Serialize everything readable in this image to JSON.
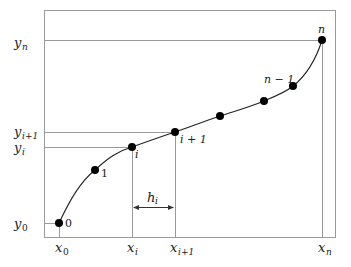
{
  "diagram": {
    "type": "piecewise-curve-interpolation",
    "frame": {
      "left": 44,
      "top": 10,
      "right": 336,
      "bottom": 238
    },
    "y_axis_labels": [
      {
        "id": "yn",
        "base": "y",
        "sub": "n",
        "y": 40
      },
      {
        "id": "yi1",
        "base": "y",
        "sub": "i+1",
        "y": 132
      },
      {
        "id": "yi",
        "base": "y",
        "sub": "i",
        "y": 147
      },
      {
        "id": "y0",
        "base": "y",
        "sub": "0",
        "y": 223
      }
    ],
    "x_axis_labels": [
      {
        "id": "x0",
        "base": "x",
        "sub": "0",
        "x": 59
      },
      {
        "id": "xi",
        "base": "x",
        "sub": "i",
        "x": 132
      },
      {
        "id": "xi1",
        "base": "x",
        "sub": "i+1",
        "x": 175
      },
      {
        "id": "xn",
        "base": "x",
        "sub": "n",
        "x": 322
      }
    ],
    "points": [
      {
        "id": "p0",
        "x": 59,
        "y": 223,
        "label": "0"
      },
      {
        "id": "p1",
        "x": 95,
        "y": 170,
        "label": "1"
      },
      {
        "id": "pi",
        "x": 132,
        "y": 147,
        "label": "i"
      },
      {
        "id": "pi1",
        "x": 175,
        "y": 132,
        "label": "i + 1"
      },
      {
        "id": "p4",
        "x": 220,
        "y": 116,
        "label": ""
      },
      {
        "id": "p5",
        "x": 264,
        "y": 101,
        "label": ""
      },
      {
        "id": "pn1",
        "x": 293,
        "y": 86,
        "label": "n − 1"
      },
      {
        "id": "pn",
        "x": 322,
        "y": 40,
        "label": "n"
      }
    ],
    "interval": {
      "label_base": "h",
      "label_sub": "i",
      "from_x": 132,
      "to_x": 175,
      "y": 207
    }
  },
  "labels": {
    "yn_base": "y",
    "yn_sub": "n",
    "yi1_base": "y",
    "yi1_sub": "i+1",
    "yi_base": "y",
    "yi_sub": "i",
    "y0_base": "y",
    "y0_sub": "0",
    "x0_base": "x",
    "x0_sub": "0",
    "xi_base": "x",
    "xi_sub": "i",
    "xi1_base": "x",
    "xi1_sub": "i+1",
    "xn_base": "x",
    "xn_sub": "n",
    "p0": "0",
    "p1": "1",
    "pi": "i",
    "pi1": "i + 1",
    "pn1": "n − 1",
    "pn": "n",
    "h_base": "h",
    "h_sub": "i"
  }
}
